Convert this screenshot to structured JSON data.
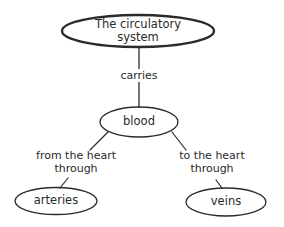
{
  "diagram": {
    "type": "concept-map",
    "colors": {
      "stroke": "#2a2a2a",
      "text": "#2a2a2a",
      "background": "#ffffff"
    },
    "nodes": {
      "root": {
        "line1": "The circulatory",
        "line2": "system"
      },
      "blood": {
        "label": "blood"
      },
      "arteries": {
        "label": "arteries"
      },
      "veins": {
        "label": "veins"
      }
    },
    "edges": {
      "root_blood": {
        "label": "carries"
      },
      "blood_arteries": {
        "line1": "from the heart",
        "line2": "through"
      },
      "blood_veins": {
        "line1": "to the heart",
        "line2": "through"
      }
    }
  }
}
